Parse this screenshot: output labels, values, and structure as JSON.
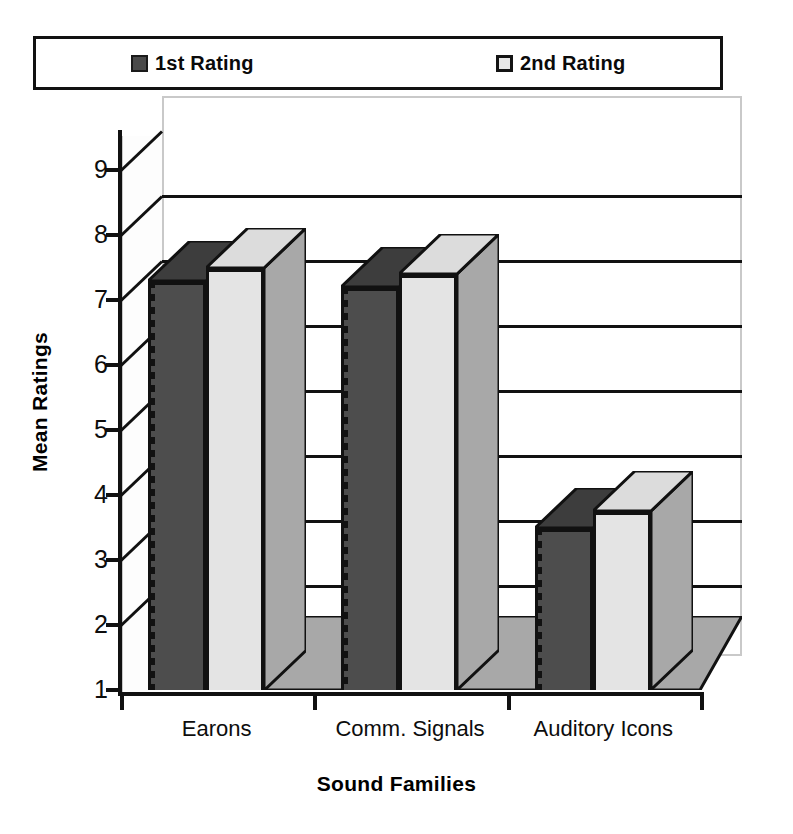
{
  "chart_data": {
    "type": "bar",
    "title": "",
    "xlabel": "Sound Families",
    "ylabel": "Mean Ratings",
    "categories": [
      "Earons",
      "Comm. Signals",
      "Auditory Icons"
    ],
    "series": [
      {
        "name": "1st Rating",
        "values": [
          7.3,
          7.2,
          3.5
        ],
        "color": "#4d4d4d"
      },
      {
        "name": "2nd Rating",
        "values": [
          7.5,
          7.4,
          3.75
        ],
        "color": "#e4e4e4"
      }
    ],
    "ylim": [
      1,
      9
    ],
    "yticks": [
      1,
      2,
      3,
      4,
      5,
      6,
      7,
      8,
      9
    ],
    "ytick_labels": [
      "1",
      "2",
      "3",
      "4",
      "5",
      "6",
      "7",
      "8",
      "9"
    ],
    "grid": true,
    "grid_axis": "y",
    "legend_position": "top",
    "style": "3d-grouped-bar",
    "annotations": []
  },
  "legend": {
    "entries": [
      {
        "label": "1st Rating",
        "swatch": "dark-square-swatch"
      },
      {
        "label": "2nd Rating",
        "swatch": "light-square-swatch"
      }
    ]
  },
  "axes": {
    "y_title": "Mean Ratings",
    "x_title": "Sound Families"
  }
}
